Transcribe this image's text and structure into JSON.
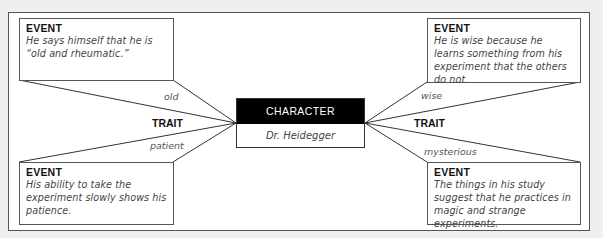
{
  "character": {
    "header": "CHARACTER",
    "name": "Dr. Heidegger"
  },
  "left": {
    "trait_label": "TRAIT",
    "top_event": {
      "title": "EVENT",
      "text": "He says himself that he is “old and rheumatic.”"
    },
    "top_trait": "old",
    "bottom_trait": "patient",
    "bottom_event": {
      "title": "EVENT",
      "text": "His ability to take the experiment slowly shows his patience."
    }
  },
  "right": {
    "trait_label": "TRAIT",
    "top_event": {
      "title": "EVENT",
      "text": "He is wise because he learns something from his experiment that the others do not."
    },
    "top_trait": "wise",
    "bottom_trait": "mysterious",
    "bottom_event": {
      "title": "EVENT",
      "text": "The things in his study suggest that he practices in magic and strange experiments."
    }
  },
  "colors": {
    "background": "#efefef",
    "frame": "#ffffff",
    "header": "#000000",
    "line": "#333333"
  }
}
